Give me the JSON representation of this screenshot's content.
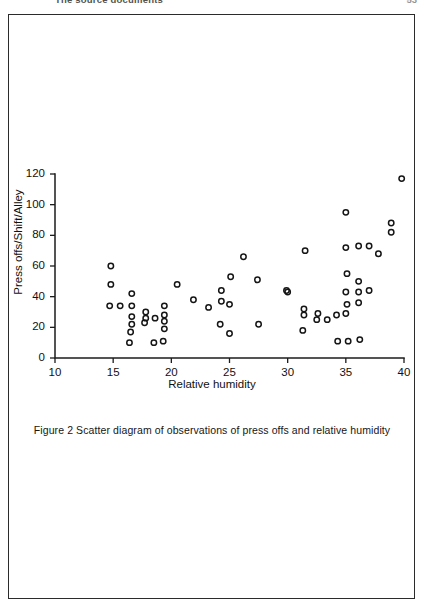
{
  "page": {
    "running_head": "The source documents",
    "page_number": "53"
  },
  "figure": {
    "caption": "Figure 2  Scatter diagram of observations of press offs and relative humidity"
  },
  "chart_data": {
    "type": "scatter",
    "title": "",
    "xlabel": "Relative humidity",
    "ylabel": "Press offs/Shift/Alley",
    "xlim": [
      10,
      40
    ],
    "ylim": [
      0,
      120
    ],
    "xticks": [
      10,
      15,
      20,
      25,
      30,
      35,
      40
    ],
    "yticks": [
      0,
      20,
      40,
      60,
      80,
      100,
      120
    ],
    "grid": false,
    "legend": null,
    "marker": "open-circle",
    "marker_color": "#151515",
    "points": [
      {
        "x": 14.8,
        "y": 60
      },
      {
        "x": 14.8,
        "y": 48
      },
      {
        "x": 14.7,
        "y": 34
      },
      {
        "x": 15.6,
        "y": 34
      },
      {
        "x": 16.6,
        "y": 42
      },
      {
        "x": 16.6,
        "y": 34
      },
      {
        "x": 16.6,
        "y": 27
      },
      {
        "x": 16.6,
        "y": 22
      },
      {
        "x": 16.5,
        "y": 17
      },
      {
        "x": 16.4,
        "y": 10
      },
      {
        "x": 17.8,
        "y": 30
      },
      {
        "x": 17.8,
        "y": 26
      },
      {
        "x": 17.7,
        "y": 23
      },
      {
        "x": 18.6,
        "y": 26
      },
      {
        "x": 18.5,
        "y": 10
      },
      {
        "x": 19.4,
        "y": 34
      },
      {
        "x": 19.4,
        "y": 28
      },
      {
        "x": 19.4,
        "y": 24
      },
      {
        "x": 19.4,
        "y": 19
      },
      {
        "x": 19.3,
        "y": 11
      },
      {
        "x": 20.5,
        "y": 48
      },
      {
        "x": 21.9,
        "y": 38
      },
      {
        "x": 23.2,
        "y": 33
      },
      {
        "x": 24.3,
        "y": 44
      },
      {
        "x": 24.3,
        "y": 37
      },
      {
        "x": 24.2,
        "y": 22
      },
      {
        "x": 25.1,
        "y": 53
      },
      {
        "x": 25.0,
        "y": 35
      },
      {
        "x": 25.0,
        "y": 16
      },
      {
        "x": 26.2,
        "y": 66
      },
      {
        "x": 27.4,
        "y": 51
      },
      {
        "x": 27.5,
        "y": 22
      },
      {
        "x": 29.9,
        "y": 44
      },
      {
        "x": 30.0,
        "y": 43
      },
      {
        "x": 31.5,
        "y": 70
      },
      {
        "x": 31.4,
        "y": 32
      },
      {
        "x": 31.4,
        "y": 28
      },
      {
        "x": 31.3,
        "y": 18
      },
      {
        "x": 32.6,
        "y": 29
      },
      {
        "x": 32.5,
        "y": 25
      },
      {
        "x": 33.4,
        "y": 25
      },
      {
        "x": 34.2,
        "y": 28
      },
      {
        "x": 34.3,
        "y": 11
      },
      {
        "x": 35.0,
        "y": 95
      },
      {
        "x": 35.0,
        "y": 72
      },
      {
        "x": 35.1,
        "y": 55
      },
      {
        "x": 35.0,
        "y": 43
      },
      {
        "x": 35.1,
        "y": 35
      },
      {
        "x": 35.0,
        "y": 29
      },
      {
        "x": 35.2,
        "y": 11
      },
      {
        "x": 36.1,
        "y": 73
      },
      {
        "x": 36.1,
        "y": 50
      },
      {
        "x": 36.1,
        "y": 43
      },
      {
        "x": 36.1,
        "y": 36
      },
      {
        "x": 36.2,
        "y": 12
      },
      {
        "x": 37.0,
        "y": 73
      },
      {
        "x": 37.0,
        "y": 44
      },
      {
        "x": 37.8,
        "y": 68
      },
      {
        "x": 38.9,
        "y": 88
      },
      {
        "x": 38.9,
        "y": 82
      },
      {
        "x": 39.8,
        "y": 117
      }
    ]
  }
}
